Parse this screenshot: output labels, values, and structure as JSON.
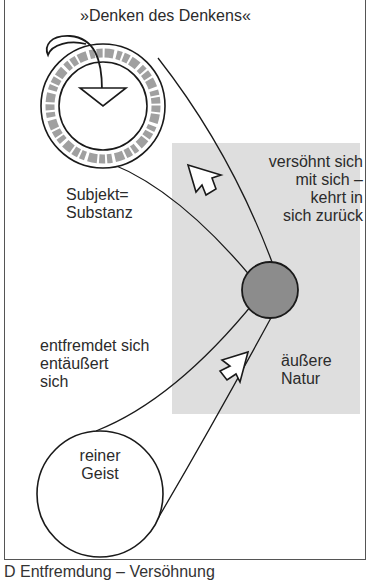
{
  "title": "»Denken des Denkens«",
  "labels": {
    "subject": [
      "Subjekt=",
      "Substanz"
    ],
    "reconciles": [
      "versöhnt sich",
      "mit sich –",
      "kehrt in",
      "sich zurück"
    ],
    "alienates": [
      "entfremdet sich",
      "entäußert",
      "sich"
    ],
    "nature": [
      "äußere",
      "Natur"
    ],
    "spirit": [
      "reiner",
      "Geist"
    ]
  },
  "caption": "D   Entfremdung – Versöhnung",
  "colors": {
    "line": "#1a1a1a",
    "shaded_area": "#dcdcdc",
    "nature_circle": "#8c8c8c",
    "ring_band": "#9a9a9a",
    "frame": "#555555"
  },
  "icons": [
    "arrow-up-left-icon",
    "arrow-up-left-icon"
  ]
}
